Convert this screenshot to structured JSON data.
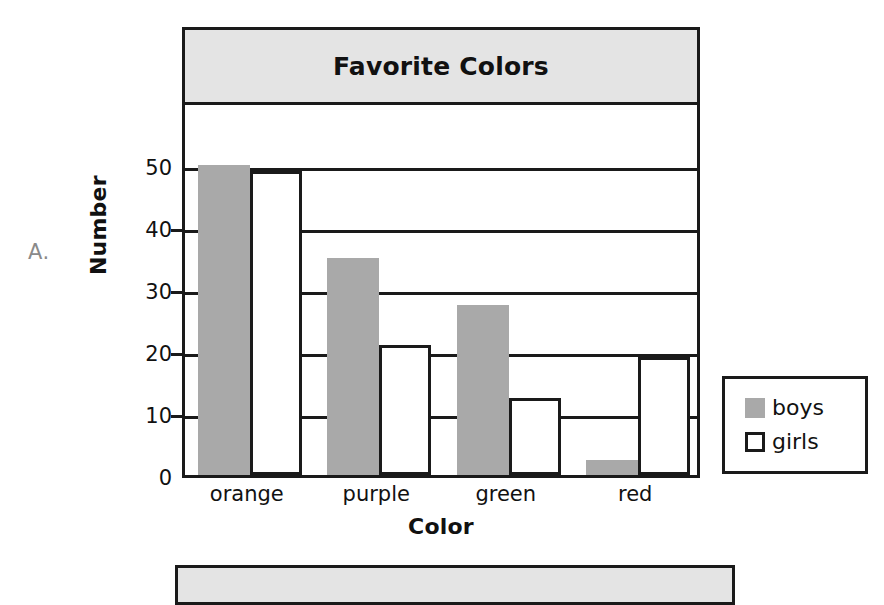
{
  "figure": {
    "label": "A."
  },
  "chart_data": {
    "type": "bar",
    "title": "Favorite Colors",
    "xlabel": "Color",
    "ylabel": "Number",
    "categories": [
      "orange",
      "purple",
      "green",
      "red"
    ],
    "series": [
      {
        "name": "boys",
        "values": [
          50,
          35,
          27.5,
          2.5
        ],
        "color": "#a9a9a9"
      },
      {
        "name": "girls",
        "values": [
          49,
          21,
          12.5,
          19
        ],
        "color": "#ffffff"
      }
    ],
    "ylim": [
      0,
      50
    ],
    "ytick_labels": [
      "0",
      "10",
      "20",
      "30",
      "40",
      "50"
    ],
    "ytick_values": [
      0,
      10,
      20,
      30,
      40,
      50
    ],
    "grid": true,
    "legend_position": "lower-right-outside",
    "legend_entries": [
      "boys",
      "girls"
    ]
  },
  "chart_b": {
    "title": ""
  }
}
